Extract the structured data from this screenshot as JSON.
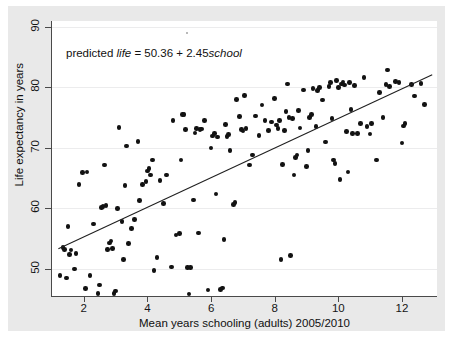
{
  "figure": {
    "background_color": "#ffffff",
    "mat_color": "#e9e9e9",
    "plot_background": "#ffffff",
    "axis_color": "#4a4a4a",
    "grid_color": "#ececed",
    "marker_color": "#121212",
    "fitline_color": "#202020"
  },
  "annotation": {
    "prefix": "predicted ",
    "var_y": "life",
    "middle": " = 50.36 + 2.45",
    "var_x": "school"
  },
  "chart_data": {
    "type": "scatter",
    "title": "",
    "xlabel": "Mean years schooling (adults) 2005/2010",
    "ylabel": "Life expectancy in years",
    "xlim": [
      1.0,
      13.1
    ],
    "ylim": [
      45.5,
      91.0
    ],
    "xticks": [
      2,
      4,
      6,
      8,
      10,
      12
    ],
    "yticks": [
      50,
      60,
      70,
      80,
      90
    ],
    "grid": "horizontal",
    "legend": "none",
    "annotations": [
      {
        "text": "predicted life = 50.36 + 2.45school",
        "x": 1.6,
        "y": 86.5
      }
    ],
    "fit_line": {
      "intercept": 50.36,
      "slope": 2.45,
      "x_start": 1.2,
      "x_end": 12.95,
      "y_start": 53.3,
      "y_end": 82.1
    },
    "points": [
      [
        1.25,
        48.9
      ],
      [
        1.35,
        53.5
      ],
      [
        1.4,
        53.2
      ],
      [
        1.45,
        48.5
      ],
      [
        1.5,
        57.0
      ],
      [
        1.55,
        52.4
      ],
      [
        1.6,
        53.1
      ],
      [
        1.7,
        50.0
      ],
      [
        1.75,
        52.5
      ],
      [
        1.85,
        63.9
      ],
      [
        1.95,
        65.9
      ],
      [
        2.05,
        46.7
      ],
      [
        2.1,
        66.0
      ],
      [
        2.2,
        48.9
      ],
      [
        2.3,
        57.4
      ],
      [
        2.45,
        45.9
      ],
      [
        2.5,
        47.3
      ],
      [
        2.55,
        60.1
      ],
      [
        2.6,
        60.3
      ],
      [
        2.65,
        67.2
      ],
      [
        2.7,
        60.5
      ],
      [
        2.75,
        53.2
      ],
      [
        2.8,
        54.3
      ],
      [
        2.85,
        54.6
      ],
      [
        2.9,
        53.4
      ],
      [
        2.95,
        45.9
      ],
      [
        3.0,
        46.3
      ],
      [
        3.05,
        60.0
      ],
      [
        3.1,
        73.4
      ],
      [
        3.2,
        57.8
      ],
      [
        3.25,
        51.5
      ],
      [
        3.3,
        63.8
      ],
      [
        3.35,
        70.3
      ],
      [
        3.4,
        54.2
      ],
      [
        3.5,
        56.7
      ],
      [
        3.6,
        58.2
      ],
      [
        3.7,
        71.1
      ],
      [
        3.75,
        61.3
      ],
      [
        3.85,
        63.9
      ],
      [
        3.95,
        64.4
      ],
      [
        4.0,
        66.2
      ],
      [
        4.05,
        66.6
      ],
      [
        4.1,
        65.5
      ],
      [
        4.15,
        68.0
      ],
      [
        4.2,
        49.7
      ],
      [
        4.3,
        51.9
      ],
      [
        4.4,
        64.6
      ],
      [
        4.5,
        60.8
      ],
      [
        4.6,
        65.5
      ],
      [
        4.75,
        50.3
      ],
      [
        4.8,
        74.5
      ],
      [
        4.9,
        55.6
      ],
      [
        5.0,
        55.8
      ],
      [
        5.05,
        68.0
      ],
      [
        5.1,
        75.5
      ],
      [
        5.15,
        75.5
      ],
      [
        5.2,
        73.0
      ],
      [
        5.25,
        50.2
      ],
      [
        5.3,
        45.8
      ],
      [
        5.35,
        50.2
      ],
      [
        5.45,
        61.4
      ],
      [
        5.5,
        72.5
      ],
      [
        5.55,
        73.2
      ],
      [
        5.6,
        55.9
      ],
      [
        5.65,
        73.0
      ],
      [
        5.7,
        73.1
      ],
      [
        5.8,
        74.5
      ],
      [
        5.9,
        46.5
      ],
      [
        6.0,
        70.0
      ],
      [
        6.05,
        72.0
      ],
      [
        6.1,
        72.4
      ],
      [
        6.15,
        62.4
      ],
      [
        6.2,
        71.8
      ],
      [
        6.3,
        46.6
      ],
      [
        6.35,
        46.8
      ],
      [
        6.4,
        54.8
      ],
      [
        6.45,
        73.9
      ],
      [
        6.5,
        71.9
      ],
      [
        6.55,
        72.2
      ],
      [
        6.6,
        69.6
      ],
      [
        6.7,
        60.6
      ],
      [
        6.75,
        61.0
      ],
      [
        6.8,
        78.0
      ],
      [
        6.9,
        75.2
      ],
      [
        6.95,
        73.0
      ],
      [
        7.0,
        72.8
      ],
      [
        7.05,
        78.7
      ],
      [
        7.1,
        73.2
      ],
      [
        7.2,
        67.2
      ],
      [
        7.3,
        68.8
      ],
      [
        7.4,
        75.3
      ],
      [
        7.5,
        72.1
      ],
      [
        7.6,
        77.1
      ],
      [
        7.7,
        74.5
      ],
      [
        7.8,
        72.9
      ],
      [
        7.9,
        74.3
      ],
      [
        8.0,
        78.2
      ],
      [
        8.05,
        73.8
      ],
      [
        8.1,
        73.2
      ],
      [
        8.15,
        74.5
      ],
      [
        8.2,
        51.5
      ],
      [
        8.25,
        67.3
      ],
      [
        8.3,
        72.9
      ],
      [
        8.35,
        76.0
      ],
      [
        8.4,
        80.6
      ],
      [
        8.45,
        75.0
      ],
      [
        8.5,
        52.2
      ],
      [
        8.55,
        74.9
      ],
      [
        8.6,
        65.5
      ],
      [
        8.65,
        68.4
      ],
      [
        8.7,
        68.8
      ],
      [
        8.75,
        76.2
      ],
      [
        8.8,
        73.3
      ],
      [
        8.9,
        79.6
      ],
      [
        9.0,
        66.9
      ],
      [
        9.05,
        69.6
      ],
      [
        9.1,
        75.0
      ],
      [
        9.15,
        75.5
      ],
      [
        9.2,
        79.8
      ],
      [
        9.3,
        73.5
      ],
      [
        9.35,
        79.5
      ],
      [
        9.4,
        80.0
      ],
      [
        9.5,
        77.9
      ],
      [
        9.6,
        71.0
      ],
      [
        9.7,
        80.2
      ],
      [
        9.75,
        80.8
      ],
      [
        9.8,
        74.9
      ],
      [
        9.85,
        68.0
      ],
      [
        9.9,
        67.4
      ],
      [
        9.95,
        81.2
      ],
      [
        10.0,
        80.0
      ],
      [
        10.05,
        64.8
      ],
      [
        10.1,
        80.6
      ],
      [
        10.15,
        80.9
      ],
      [
        10.2,
        80.4
      ],
      [
        10.25,
        72.7
      ],
      [
        10.3,
        66.0
      ],
      [
        10.35,
        80.8
      ],
      [
        10.4,
        76.4
      ],
      [
        10.45,
        72.4
      ],
      [
        10.5,
        80.3
      ],
      [
        10.6,
        72.4
      ],
      [
        10.7,
        74.0
      ],
      [
        10.8,
        81.7
      ],
      [
        10.9,
        73.5
      ],
      [
        11.0,
        72.3
      ],
      [
        11.05,
        74.0
      ],
      [
        11.2,
        68.0
      ],
      [
        11.3,
        79.2
      ],
      [
        11.4,
        75.0
      ],
      [
        11.5,
        80.5
      ],
      [
        11.55,
        82.9
      ],
      [
        11.6,
        80.2
      ],
      [
        11.8,
        81.0
      ],
      [
        11.9,
        80.8
      ],
      [
        12.0,
        70.8
      ],
      [
        12.05,
        73.6
      ],
      [
        12.1,
        74.0
      ],
      [
        12.3,
        80.5
      ],
      [
        12.4,
        78.6
      ],
      [
        12.6,
        80.7
      ],
      [
        12.7,
        77.2
      ]
    ]
  }
}
